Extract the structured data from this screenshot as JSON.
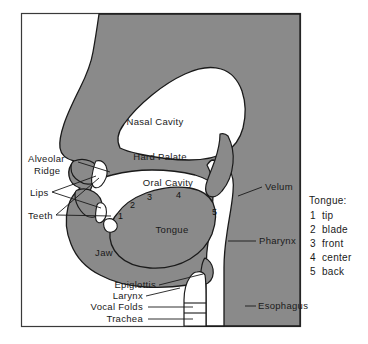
{
  "figure": {
    "frame": {
      "border_color": "#3a3a3a"
    },
    "colors": {
      "tissue": "#8a8a8a",
      "cavity": "#ffffff",
      "outline": "#1a1a1a",
      "background": "#ffffff",
      "text": "#1a1a1a"
    }
  },
  "labels": {
    "nasal_cavity": "Nasal Cavity",
    "hard_palate": "Hard Palate",
    "oral_cavity": "Oral Cavity",
    "alveolar_ridge_line1": "Alveolar",
    "alveolar_ridge_line2": "Ridge",
    "lips": "Lips",
    "teeth": "Teeth",
    "tongue": "Tongue",
    "jaw": "Jaw",
    "velum": "Velum",
    "pharynx": "Pharynx",
    "esophagus": "Esophagus",
    "epiglottis": "Epiglottis",
    "larynx": "Larynx",
    "vocal_folds": "Vocal Folds",
    "trachea": "Trachea"
  },
  "tongue_numbers": {
    "n1": "1",
    "n2": "2",
    "n3": "3",
    "n4": "4",
    "n5": "5"
  },
  "legend": {
    "title": "Tongue:",
    "items": [
      {
        "number": "1",
        "name": "tip"
      },
      {
        "number": "2",
        "name": "blade"
      },
      {
        "number": "3",
        "name": "front"
      },
      {
        "number": "4",
        "name": "center"
      },
      {
        "number": "5",
        "name": "back"
      }
    ]
  }
}
